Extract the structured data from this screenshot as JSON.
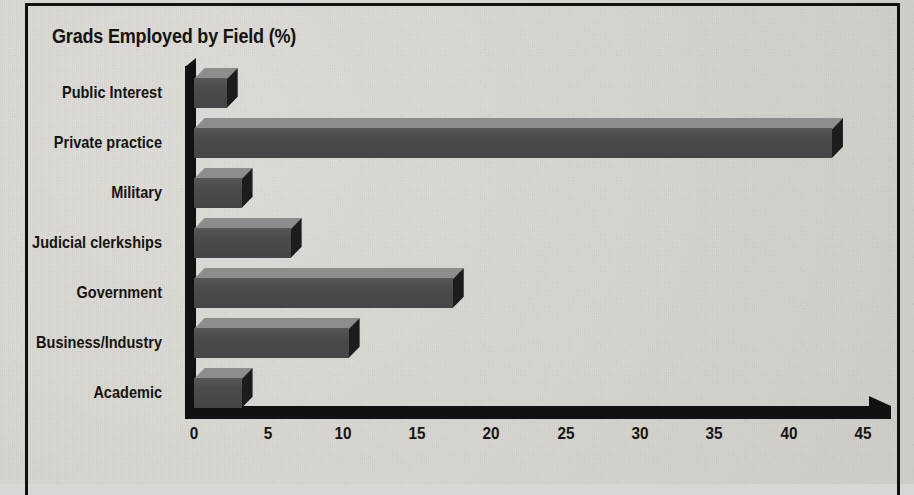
{
  "chart_data": {
    "type": "bar",
    "orientation": "horizontal",
    "title": "Grads Employed by Field (%)",
    "xlabel": "",
    "ylabel": "",
    "categories": [
      "Public Interest",
      "Private practice",
      "Military",
      "Judicial clerkships",
      "Government",
      "Business/Industry",
      "Academic"
    ],
    "values": [
      2.2,
      42.9,
      3.2,
      6.5,
      17.4,
      10.4,
      3.2
    ],
    "xticks": [
      0,
      5,
      10,
      15,
      20,
      25,
      30,
      35,
      40,
      45
    ],
    "xlim": [
      0,
      45
    ],
    "grid": false,
    "legend": null,
    "style": {
      "bar_top_color": "#8d8d8d",
      "bar_front_color": "#4b4b4b",
      "bar_side_color": "#1c1c1c",
      "axis_color": "#111111",
      "background_color": "#d9d7d3",
      "text_color": "#15140f"
    }
  }
}
